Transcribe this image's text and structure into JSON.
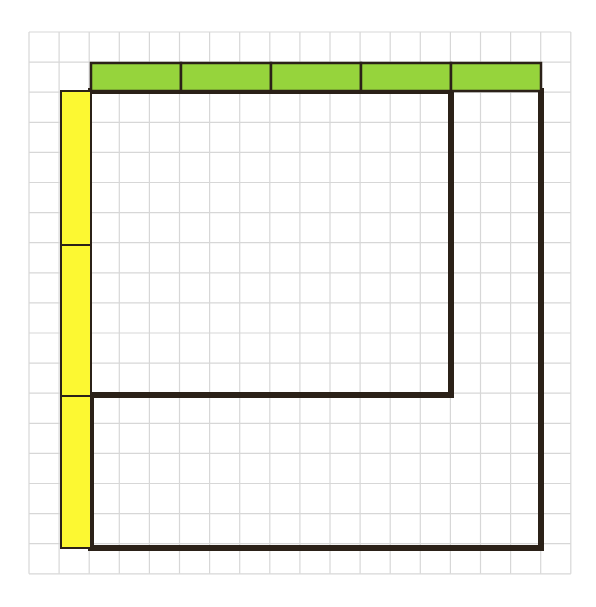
{
  "canvas": {
    "width": 596,
    "height": 607,
    "background_color": "#ffffff"
  },
  "grid": {
    "name": "graph-paper-grid",
    "origin_x": 29,
    "origin_y": 32,
    "cell_size": 30.1,
    "columns": 18,
    "rows": 18,
    "line_color": "#d7d7d7",
    "line_width": 1.2,
    "description": "Light gray square grid covering the whole drawing area"
  },
  "shape": {
    "name": "l-shaped-outline",
    "stroke_color": "#2b2118",
    "stroke_width": 6,
    "fill": "none",
    "description": "Thick dark L-shaped (notched rectangle) outline drawn on the grid",
    "vertices_px": [
      [
        91,
        91
      ],
      [
        451,
        91
      ],
      [
        451,
        395
      ],
      [
        91,
        395
      ],
      [
        91,
        548
      ],
      [
        541,
        548
      ],
      [
        541,
        91
      ]
    ],
    "closed": false,
    "units": {
      "top_run_cells": 12,
      "right_inner_drop_cells": 10,
      "inner_left_run_cells": 12,
      "left_lower_drop_cells": 5,
      "bottom_run_cells": 15,
      "right_outer_rise_cells": 15
    }
  },
  "green_bar": {
    "name": "green-measuring-strip",
    "fill_color": "#96d43c",
    "stroke_color": "#2b2118",
    "stroke_width": 2.5,
    "x": 91,
    "y": 63,
    "width": 450,
    "height": 28,
    "segments": 5,
    "segment_cells": 3,
    "total_cells": 15,
    "orientation": "horizontal",
    "position_label": "above-top-edge",
    "description": "Horizontal green strip of 5 equal segments laid along the top of the figure"
  },
  "yellow_bar": {
    "name": "yellow-measuring-strip",
    "fill_color": "#fcf832",
    "stroke_color": "#2b2118",
    "stroke_width": 2.0,
    "x": 61,
    "y": 91,
    "width": 30,
    "height": 457,
    "segments": 3,
    "segment_cells": 5,
    "total_cells": 15,
    "orientation": "vertical",
    "segment_boundaries_y": [
      91,
      245,
      396,
      548
    ],
    "position_label": "left-of-left-edge",
    "description": "Vertical yellow strip of 3 equal segments laid along the left side of the figure"
  },
  "chart_data": {
    "type": "diagram",
    "title": "",
    "xlabel": "",
    "ylabel": "",
    "grid": true,
    "legend": "none",
    "series": [
      {
        "name": "green-strip-segments",
        "color": "#96d43c",
        "count": 5,
        "values": [
          3,
          3,
          3,
          3,
          3
        ],
        "unit": "grid cells"
      },
      {
        "name": "yellow-strip-segments",
        "color": "#fcf832",
        "count": 3,
        "values": [
          5,
          5,
          5
        ],
        "unit": "grid cells"
      }
    ]
  }
}
